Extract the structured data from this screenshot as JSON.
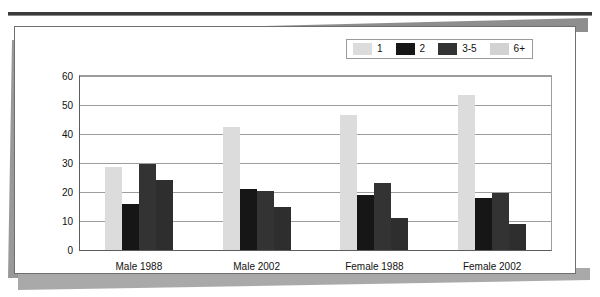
{
  "page": {
    "cut_off_title": "",
    "card_background": "#ffffff",
    "frame_color": "#6f6f6f"
  },
  "legend": {
    "position": "top-right",
    "items": [
      {
        "label": "1",
        "color": "#dcdcdc"
      },
      {
        "label": "2",
        "color": "#161616"
      },
      {
        "label": "3-5",
        "color": "#333333"
      },
      {
        "label": "6+",
        "color": "#d2d2d2"
      }
    ]
  },
  "axis": {
    "y_ticks": [
      "60",
      "50",
      "40",
      "30",
      "20",
      "10",
      "0"
    ],
    "x_labels": [
      "Male 1988",
      "Male 2002",
      "Female 1988",
      "Female 2002"
    ]
  },
  "chart_data": {
    "type": "bar",
    "title": "",
    "xlabel": "",
    "ylabel": "",
    "ylim": [
      0,
      60
    ],
    "ytick_step": 10,
    "grid": true,
    "legend_position": "top-right",
    "categories": [
      "Male 1988",
      "Male 2002",
      "Female 1988",
      "Female 2002"
    ],
    "series": [
      {
        "name": "1",
        "color": "#dcdcdc",
        "values": [
          28.5,
          42.5,
          46.5,
          53.5
        ]
      },
      {
        "name": "2",
        "color": "#161616",
        "values": [
          16.0,
          21.0,
          19.0,
          18.0
        ]
      },
      {
        "name": "3-5",
        "color": "#333333",
        "values": [
          29.5,
          20.5,
          23.0,
          19.5
        ]
      },
      {
        "name": "6+",
        "color": "#2e2e2e",
        "values": [
          24.0,
          15.0,
          11.0,
          9.0
        ]
      }
    ]
  }
}
